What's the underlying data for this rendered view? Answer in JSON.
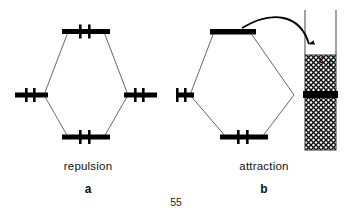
{
  "figure": {
    "page_number": "55",
    "panels": [
      {
        "id": "a",
        "caption": "repulsion",
        "letter": "a",
        "type": "molecular-orbital-interaction-diagram",
        "description": "Two filled levels interacting: both bonding and antibonding levels occupied",
        "levels": [
          {
            "name": "antibonding-level",
            "position": "top",
            "electrons": 2,
            "filled": true,
            "label": ""
          },
          {
            "name": "left-atomic-level",
            "position": "middle-left",
            "electrons": 2,
            "filled": true,
            "label": ""
          },
          {
            "name": "right-atomic-level",
            "position": "middle-right",
            "electrons": 2,
            "filled": true,
            "label": ""
          },
          {
            "name": "bonding-level",
            "position": "bottom",
            "electrons": 2,
            "filled": true,
            "label": ""
          }
        ]
      },
      {
        "id": "b",
        "caption": "attraction",
        "letter": "b",
        "type": "molecular-orbital-interaction-diagram-with-metal-band",
        "description": "Antibonding level empties its electrons into the metal band below the Fermi level",
        "levels": [
          {
            "name": "antibonding-level",
            "position": "top",
            "electrons": 0,
            "filled": false,
            "label": ""
          },
          {
            "name": "left-atomic-level",
            "position": "middle-left",
            "electrons": 2,
            "filled": true,
            "label": ""
          },
          {
            "name": "right-atomic-level",
            "position": "middle-right",
            "electrons": 2,
            "filled": true,
            "label": ""
          },
          {
            "name": "bonding-level",
            "position": "bottom",
            "electrons": 2,
            "filled": true,
            "label": ""
          }
        ],
        "band": {
          "name": "metal-band",
          "fill_label": "ϵ",
          "fill_label_subscript": "F",
          "fermi_level_text": "ϵF",
          "hatch_pattern": "cross-hatch",
          "filled_marker": "solid-black-bar"
        },
        "arrow": {
          "name": "electron-transfer-arrow",
          "description": "curved arrow from antibonding level into band below Fermi level"
        }
      }
    ]
  },
  "colors": {
    "ink": "#000000",
    "background": "#ffffff",
    "hairline": "#4a4a4a",
    "hatch": "#1a1a1a"
  }
}
